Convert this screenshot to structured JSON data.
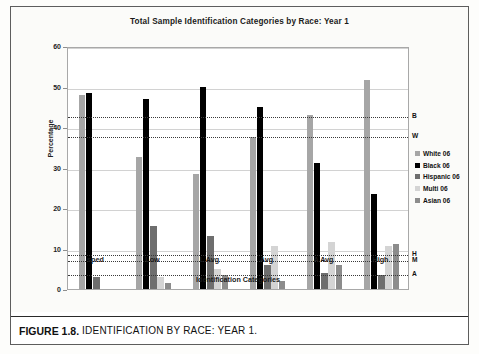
{
  "figure": {
    "caption_label": "FIGURE 1.8.",
    "caption_text": "IDENTIFICATION BY RACE: YEAR 1."
  },
  "chart_data": {
    "type": "bar",
    "title": "Total Sample Identification Categories by Race: Year 1",
    "xlabel": "Identification Categories",
    "ylabel": "Percentage",
    "ylim": [
      0,
      60
    ],
    "yticks": [
      0,
      10,
      20,
      30,
      40,
      50,
      60
    ],
    "grid": true,
    "legend_position": "right",
    "categories": [
      "sped",
      "Low",
      "L Avg",
      "Avg",
      "A Avg",
      "High"
    ],
    "series": [
      {
        "name": "White 06",
        "color": "#a6a6a6",
        "values": [
          48.0,
          32.5,
          28.5,
          37.5,
          43.0,
          51.5
        ]
      },
      {
        "name": "Black 06",
        "color": "#000000",
        "values": [
          48.3,
          47.0,
          50.0,
          45.0,
          31.0,
          23.5
        ]
      },
      {
        "name": "Hispanic 06",
        "color": "#6e6e6e",
        "values": [
          3.0,
          15.5,
          13.0,
          6.0,
          4.0,
          3.5
        ]
      },
      {
        "name": "Multi 06",
        "color": "#d4d4d4",
        "values": [
          0.0,
          3.0,
          5.0,
          10.5,
          11.5,
          10.5
        ]
      },
      {
        "name": "Asian 06",
        "color": "#8c8c8c",
        "values": [
          0.0,
          1.5,
          3.5,
          2.0,
          6.0,
          11.0
        ]
      }
    ],
    "reference_lines": [
      {
        "label": "B",
        "value": 43.0
      },
      {
        "label": "W",
        "value": 38.0
      },
      {
        "label": "H",
        "value": 9.0
      },
      {
        "label": "M",
        "value": 7.5
      },
      {
        "label": "A",
        "value": 4.0
      }
    ]
  }
}
